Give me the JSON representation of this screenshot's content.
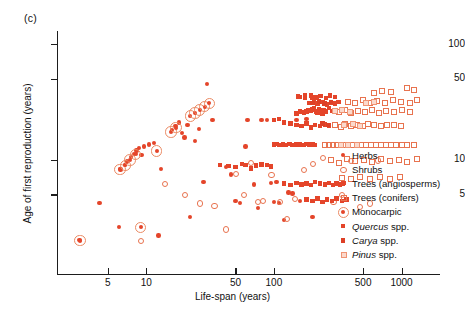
{
  "figure": {
    "panel_label": "(c)",
    "accent_color": "#e4452a",
    "accent_light": "#e8734f",
    "background": "#ffffff"
  },
  "chart_data": {
    "type": "scatter",
    "title": "",
    "panel": "(c)",
    "xlabel": "Life-span (years)",
    "ylabel": "Age of first reproduction (years)",
    "xscale": "log",
    "yscale": "log",
    "xlim": [
      2,
      2000
    ],
    "ylim": [
      1,
      130
    ],
    "grid": false,
    "xticks": [
      5,
      10,
      50,
      100,
      500,
      1000
    ],
    "xtick_labels": [
      "5",
      "10",
      "50",
      "100",
      "500",
      "1000"
    ],
    "yticks": [
      5,
      10,
      50,
      100
    ],
    "ytick_labels": [
      "5",
      "10",
      "50",
      "100"
    ],
    "legend_position": "right",
    "series": [
      {
        "name": "Herbs",
        "marker": "filled-circle",
        "color": "#e4452a",
        "points": [
          [
            3.0,
            2.0
          ],
          [
            4.3,
            4.2
          ],
          [
            6.1,
            2.6
          ],
          [
            6.3,
            8.2
          ],
          [
            6.8,
            9.0
          ],
          [
            7.1,
            9.6
          ],
          [
            7.6,
            10.5
          ],
          [
            8.0,
            11.2
          ],
          [
            8.4,
            12.0
          ],
          [
            8.8,
            12.6
          ],
          [
            9.2,
            11.0
          ],
          [
            9.6,
            13.0
          ],
          [
            10.5,
            13.5
          ],
          [
            11.5,
            14.0
          ],
          [
            12.5,
            2.2
          ],
          [
            13.0,
            8.3
          ],
          [
            16.0,
            18.0
          ],
          [
            17.0,
            19.5
          ],
          [
            18.0,
            21.0
          ],
          [
            19.0,
            17.0
          ],
          [
            20.0,
            15.5
          ],
          [
            21.0,
            20.0
          ],
          [
            22.0,
            3.2
          ],
          [
            24.0,
            14.5
          ],
          [
            26.0,
            18.5
          ],
          [
            28.0,
            6.4
          ],
          [
            30.0,
            45.0
          ],
          [
            33.0,
            22.0
          ],
          [
            38.0,
            9.0
          ],
          [
            42.0,
            8.6
          ],
          [
            46.0,
            7.4
          ],
          [
            50.0,
            4.4
          ],
          [
            54.0,
            4.2
          ],
          [
            60.0,
            13.0
          ],
          [
            62.0,
            22.0
          ],
          [
            70.0,
            6.1
          ],
          [
            75.0,
            3.8
          ],
          [
            80.0,
            22.0
          ],
          [
            88.0,
            22.0
          ],
          [
            95.0,
            6.3
          ],
          [
            100.0,
            4.3
          ],
          [
            105.0,
            6.4
          ],
          [
            110.0,
            4.2
          ],
          [
            120.0,
            3.0
          ],
          [
            130.0,
            5.2
          ],
          [
            140.0,
            5.1
          ],
          [
            150.0,
            22.0
          ],
          [
            160.0,
            4.4
          ],
          [
            180.0,
            22.5
          ],
          [
            200.0,
            3.2
          ]
        ]
      },
      {
        "name": "Shrubs",
        "marker": "open-circle",
        "color": "#e8734f",
        "points": [
          [
            9.0,
            2.0
          ],
          [
            14.0,
            6.2
          ],
          [
            20.0,
            5.0
          ],
          [
            26.0,
            4.2
          ],
          [
            34.0,
            4.0
          ],
          [
            42.0,
            2.5
          ],
          [
            50.0,
            7.6
          ],
          [
            58.0,
            5.0
          ],
          [
            66.0,
            9.5
          ],
          [
            74.0,
            4.3
          ],
          [
            82.0,
            4.4
          ],
          [
            95.0,
            7.4
          ],
          [
            110.0,
            4.3
          ],
          [
            125.0,
            3.1
          ],
          [
            145.0,
            4.6
          ],
          [
            170.0,
            8.2
          ],
          [
            200.0,
            9.3
          ],
          [
            240.0,
            10.5
          ],
          [
            290.0,
            4.3
          ],
          [
            340.0,
            5.0
          ],
          [
            400.0,
            9.8
          ],
          [
            470.0,
            3.9
          ],
          [
            560.0,
            4.2
          ],
          [
            650.0,
            9.9
          ]
        ]
      },
      {
        "name": "Trees (angiosperms)",
        "marker": "filled-square",
        "color": "#e4452a",
        "points": [
          [
            38.0,
            9.0
          ],
          [
            44.0,
            8.8
          ],
          [
            50.0,
            8.6
          ],
          [
            56.0,
            9.2
          ],
          [
            60.0,
            9.0
          ],
          [
            66.0,
            8.4
          ],
          [
            72.0,
            8.9
          ],
          [
            80.0,
            9.1
          ],
          [
            88.0,
            9.0
          ],
          [
            95.0,
            8.7
          ],
          [
            100.0,
            13.5
          ],
          [
            105.0,
            13.6
          ],
          [
            110.0,
            13.4
          ],
          [
            118.0,
            13.5
          ],
          [
            125.0,
            13.3
          ],
          [
            132.0,
            13.6
          ],
          [
            140.0,
            13.4
          ],
          [
            150.0,
            13.5
          ],
          [
            160.0,
            13.5
          ],
          [
            170.0,
            13.4
          ],
          [
            180.0,
            13.6
          ],
          [
            190.0,
            13.5
          ],
          [
            200.0,
            13.5
          ],
          [
            210.0,
            13.4
          ],
          [
            150.0,
            25.0
          ],
          [
            160.0,
            26.0
          ],
          [
            172.0,
            25.5
          ],
          [
            185.0,
            27.0
          ],
          [
            195.0,
            26.5
          ],
          [
            205.0,
            28.0
          ],
          [
            215.0,
            26.0
          ],
          [
            225.0,
            27.5
          ],
          [
            240.0,
            25.0
          ],
          [
            255.0,
            26.0
          ],
          [
            270.0,
            28.0
          ],
          [
            285.0,
            26.5
          ],
          [
            150.0,
            20.0
          ],
          [
            165.0,
            19.5
          ],
          [
            180.0,
            20.5
          ],
          [
            195.0,
            19.0
          ],
          [
            210.0,
            20.0
          ],
          [
            230.0,
            19.5
          ],
          [
            250.0,
            20.2
          ],
          [
            270.0,
            19.8
          ],
          [
            120.0,
            21.0
          ],
          [
            135.0,
            20.5
          ],
          [
            100.0,
            22.0
          ],
          [
            110.0,
            22.5
          ],
          [
            190.0,
            31.0
          ],
          [
            205.0,
            32.0
          ],
          [
            220.0,
            30.5
          ],
          [
            240.0,
            31.5
          ],
          [
            260.0,
            30.0
          ],
          [
            280.0,
            31.0
          ],
          [
            300.0,
            30.5
          ],
          [
            320.0,
            31.5
          ],
          [
            160.0,
            35.0
          ],
          [
            175.0,
            34.0
          ],
          [
            195.0,
            36.0
          ],
          [
            215.0,
            34.5
          ],
          [
            235.0,
            35.5
          ],
          [
            255.0,
            34.0
          ],
          [
            275.0,
            36.0
          ],
          [
            300.0,
            35.0
          ],
          [
            120.0,
            6.2
          ],
          [
            135.0,
            6.0
          ],
          [
            150.0,
            6.3
          ],
          [
            165.0,
            6.1
          ],
          [
            180.0,
            6.2
          ],
          [
            195.0,
            6.0
          ],
          [
            210.0,
            6.4
          ],
          [
            230.0,
            6.2
          ],
          [
            250.0,
            6.1
          ],
          [
            270.0,
            6.3
          ],
          [
            290.0,
            6.0
          ],
          [
            310.0,
            6.2
          ],
          [
            330.0,
            6.1
          ],
          [
            350.0,
            6.3
          ],
          [
            180.0,
            4.5
          ],
          [
            200.0,
            4.4
          ],
          [
            220.0,
            4.6
          ],
          [
            240.0,
            4.3
          ],
          [
            260.0,
            4.5
          ],
          [
            285.0,
            4.4
          ],
          [
            310.0,
            4.6
          ],
          [
            340.0,
            4.4
          ],
          [
            370.0,
            4.5
          ]
        ]
      },
      {
        "name": "Trees (conifers)",
        "marker": "open-square",
        "color": "#e8734f",
        "points": [
          [
            250.0,
            13.5
          ],
          [
            270.0,
            13.4
          ],
          [
            290.0,
            13.6
          ],
          [
            310.0,
            13.5
          ],
          [
            330.0,
            13.4
          ],
          [
            355.0,
            13.5
          ],
          [
            380.0,
            13.6
          ],
          [
            410.0,
            13.5
          ],
          [
            440.0,
            13.4
          ],
          [
            480.0,
            13.5
          ],
          [
            520.0,
            13.6
          ],
          [
            570.0,
            13.5
          ],
          [
            620.0,
            13.4
          ],
          [
            680.0,
            13.5
          ],
          [
            750.0,
            13.6
          ],
          [
            820.0,
            13.5
          ],
          [
            900.0,
            13.4
          ],
          [
            1000.0,
            13.5
          ],
          [
            1100.0,
            13.6
          ],
          [
            1250.0,
            13.5
          ],
          [
            300.0,
            20.0
          ],
          [
            330.0,
            19.5
          ],
          [
            360.0,
            20.5
          ],
          [
            400.0,
            19.8
          ],
          [
            440.0,
            20.2
          ],
          [
            490.0,
            19.6
          ],
          [
            540.0,
            20.4
          ],
          [
            600.0,
            20.0
          ],
          [
            680.0,
            19.8
          ],
          [
            760.0,
            20.2
          ],
          [
            860.0,
            20.0
          ],
          [
            980.0,
            19.7
          ],
          [
            320.0,
            26.0
          ],
          [
            360.0,
            27.0
          ],
          [
            400.0,
            25.5
          ],
          [
            450.0,
            26.5
          ],
          [
            510.0,
            26.0
          ],
          [
            580.0,
            27.0
          ],
          [
            660.0,
            25.8
          ],
          [
            750.0,
            26.4
          ],
          [
            860.0,
            26.0
          ],
          [
            1000.0,
            27.0
          ],
          [
            1150.0,
            26.2
          ],
          [
            380.0,
            32.0
          ],
          [
            430.0,
            31.0
          ],
          [
            490.0,
            33.0
          ],
          [
            560.0,
            31.5
          ],
          [
            640.0,
            32.5
          ],
          [
            740.0,
            31.0
          ],
          [
            850.0,
            33.0
          ],
          [
            980.0,
            32.0
          ],
          [
            1150.0,
            31.5
          ],
          [
            1300.0,
            33.0
          ],
          [
            280.0,
            10.0
          ],
          [
            320.0,
            9.5
          ],
          [
            370.0,
            10.2
          ],
          [
            430.0,
            9.8
          ],
          [
            500.0,
            10.0
          ],
          [
            580.0,
            9.6
          ],
          [
            680.0,
            10.3
          ],
          [
            800.0,
            9.9
          ],
          [
            950.0,
            10.1
          ],
          [
            1100.0,
            9.7
          ],
          [
            1300.0,
            10.2
          ],
          [
            340.0,
            7.0
          ],
          [
            400.0,
            6.8
          ],
          [
            470.0,
            7.2
          ],
          [
            560.0,
            6.9
          ],
          [
            670.0,
            7.1
          ],
          [
            800.0,
            6.8
          ],
          [
            960.0,
            7.2
          ],
          [
            600.0,
            38.0
          ],
          [
            700.0,
            40.0
          ],
          [
            820.0,
            39.0
          ],
          [
            1100.0,
            42.0
          ],
          [
            1250.0,
            40.5
          ]
        ]
      },
      {
        "name": "Monocarpic",
        "marker": "monocarpic-ring",
        "color": "#eb8a63",
        "points": [
          [
            3.0,
            2.0
          ],
          [
            6.2,
            8.3
          ],
          [
            6.8,
            9.0
          ],
          [
            7.4,
            10.0
          ],
          [
            8.2,
            11.2
          ],
          [
            9.0,
            2.6
          ],
          [
            12.0,
            12.0
          ],
          [
            15.5,
            17.5
          ],
          [
            17.0,
            19.0
          ],
          [
            22.0,
            24.0
          ],
          [
            24.0,
            25.5
          ],
          [
            26.0,
            27.0
          ],
          [
            28.5,
            29.0
          ],
          [
            31.0,
            31.0
          ]
        ]
      },
      {
        "name": "Quercus spp.",
        "marker": "filled-square-quercus",
        "color": "#e4452a",
        "points": [
          [
            180.0,
            26.0
          ],
          [
            200.0,
            27.0
          ],
          [
            220.0,
            25.5
          ],
          [
            245.0,
            26.5
          ],
          [
            270.0,
            28.0
          ],
          [
            300.0,
            26.0
          ],
          [
            155.0,
            35.0
          ],
          [
            175.0,
            36.0
          ],
          [
            200.0,
            34.5
          ],
          [
            230.0,
            35.5
          ]
        ]
      },
      {
        "name": "Carya spp.",
        "marker": "filled-square-carya",
        "color": "#dd3f26",
        "points": [
          [
            200.0,
            31.0
          ],
          [
            225.0,
            32.0
          ],
          [
            250.0,
            30.5
          ],
          [
            280.0,
            31.5
          ],
          [
            240.0,
            20.5
          ],
          [
            265.0,
            20.0
          ]
        ]
      },
      {
        "name": "Pinus spp.",
        "marker": "light-square",
        "color": "#ef9373",
        "points": [
          [
            300.0,
            26.5
          ],
          [
            340.0,
            27.0
          ],
          [
            390.0,
            26.0
          ],
          [
            350.0,
            20.0
          ],
          [
            410.0,
            20.4
          ],
          [
            470.0,
            19.8
          ],
          [
            330.0,
            13.5
          ],
          [
            380.0,
            13.4
          ],
          [
            440.0,
            13.6
          ],
          [
            520.0,
            31.5
          ],
          [
            600.0,
            32.0
          ]
        ]
      }
    ]
  },
  "legend": {
    "items": [
      {
        "label": "Herbs",
        "marker": "filled-circle",
        "italic": false
      },
      {
        "label": "Shrubs",
        "marker": "open-circle",
        "italic": false
      },
      {
        "label": "Trees (angiosperms)",
        "marker": "filled-square",
        "italic": false
      },
      {
        "label": "Trees (conifers)",
        "marker": "open-square",
        "italic": false
      },
      {
        "label": "Monocarpic",
        "marker": "monocarpic-ring",
        "italic": false
      },
      {
        "label": "Quercus spp.",
        "marker": "filled-square-quercus",
        "italic": true,
        "italic_part": "Quercus",
        "plain_part": " spp."
      },
      {
        "label": "Carya spp.",
        "marker": "filled-square-carya",
        "italic": true,
        "italic_part": "Carya",
        "plain_part": " spp."
      },
      {
        "label": "Pinus spp.",
        "marker": "light-square",
        "italic": true,
        "italic_part": "Pinus",
        "plain_part": " spp."
      }
    ]
  }
}
